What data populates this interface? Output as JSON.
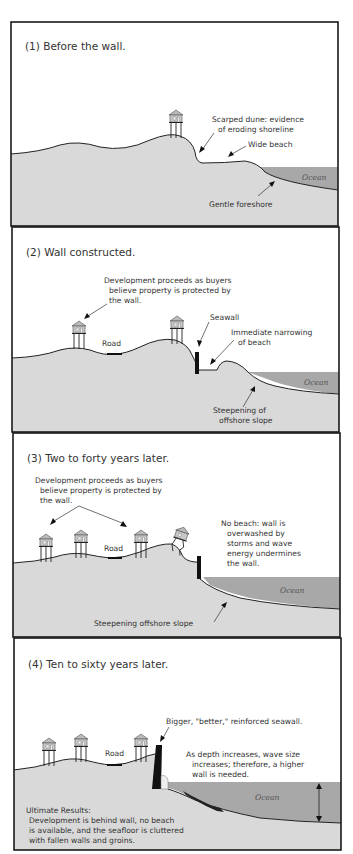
{
  "panels": [
    {
      "title": "(1) Before the wall.",
      "labels": {
        "scarped_dune_1": "Scarped dune: evidence",
        "scarped_dune_2": "of eroding shoreline",
        "wide_beach": "Wide beach",
        "gentle_foreshore": "Gentle foreshore",
        "ocean": "Ocean"
      }
    },
    {
      "title": "(2) Wall constructed.",
      "labels": {
        "development_1": "Development proceeds as buyers",
        "development_2": "believe property is protected by",
        "development_3": "the wall.",
        "road": "Road",
        "seawall": "Seawall",
        "narrowing_1": "Immediate narrowing",
        "narrowing_2": "of beach",
        "steepening_1": "Steepening of",
        "steepening_2": "offshore slope",
        "ocean": "Ocean"
      }
    },
    {
      "title": "(3) Two to forty years later.",
      "labels": {
        "development_1": "Development proceeds as buyers",
        "development_2": "believe property is protected by",
        "development_3": "the wall.",
        "road": "Road",
        "no_beach_1": "No beach: wall is",
        "no_beach_2": "overwashed by",
        "no_beach_3": "storms and wave",
        "no_beach_4": "energy undermines",
        "no_beach_5": "the wall.",
        "steepening": "Steepening offshore slope",
        "ocean": "Ocean"
      }
    },
    {
      "title": "(4) Ten to sixty years later.",
      "labels": {
        "bigger_wall": "Bigger, \"better,\" reinforced seawall.",
        "road": "Road",
        "depth_1": "As depth increases, wave size",
        "depth_2": "increases; therefore, a higher",
        "depth_3": "wall is needed.",
        "ultimate_1": "Ultimate Results:",
        "ultimate_2": "Development is behind wall, no beach",
        "ultimate_3": "is available, and the seafloor is cluttered",
        "ultimate_4": "with fallen walls and groins.",
        "ocean": "Ocean"
      }
    }
  ],
  "colors": {
    "ground": "#d9d9d9",
    "ocean": "#a8a8a8",
    "frame": "#1a1a1a",
    "background": "#ffffff"
  }
}
